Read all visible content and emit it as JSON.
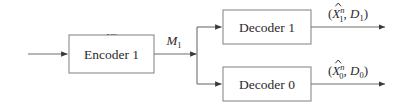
{
  "diagram": {
    "type": "block-diagram",
    "background_color": "#ffffff",
    "line_color": "#8a8a8a",
    "arrow_color": "#3a3a3a",
    "text_color": "#2b2b2b",
    "blocks": [
      {
        "id": "encoder1",
        "label": "Encoder 1",
        "x": 69,
        "y": 35,
        "w": 85,
        "h": 38
      },
      {
        "id": "decoder1",
        "label": "Decoder 1",
        "x": 223,
        "y": 10,
        "w": 88,
        "h": 34
      },
      {
        "id": "decoder0",
        "label": "Decoder 0",
        "x": 223,
        "y": 67,
        "w": 88,
        "h": 34
      }
    ],
    "signals": {
      "input": {
        "base": "X",
        "superscript": "n",
        "subscript": "",
        "full": "X^n"
      },
      "message": {
        "base": "M",
        "superscript": "",
        "subscript": "1",
        "full": "M_1"
      },
      "output_top": {
        "open_paren": "(",
        "hat_base": "X",
        "superscript": "n",
        "subscript": "1",
        "comma": ", ",
        "distortion_base": "D",
        "distortion_sub": "1",
        "close_paren": ")",
        "full": "(X̂_1^n, D_1)"
      },
      "output_bottom": {
        "open_paren": "(",
        "hat_base": "X",
        "superscript": "n",
        "subscript": "0",
        "comma": ", ",
        "distortion_base": "D",
        "distortion_sub": "0",
        "close_paren": ")",
        "full": "(X̂_0^n, D_0)"
      }
    }
  }
}
